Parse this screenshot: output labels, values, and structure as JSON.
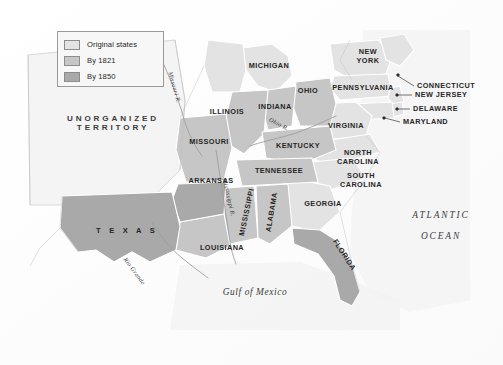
{
  "figure": {
    "background_color": "#fdfdfd",
    "ocean_color": "#f2f2f2"
  },
  "legend": {
    "name": "map-legend",
    "border_color": "#9a9a9a",
    "background_color": "#f7f7f7",
    "items": [
      {
        "label": "Original states",
        "color": "#e3e3e3"
      },
      {
        "label": "By 1821",
        "color": "#c6c6c6"
      },
      {
        "label": "By 1850",
        "color": "#a9a9a9"
      }
    ]
  },
  "map": {
    "territory": {
      "line1": "UNORGANIZED",
      "line2": "TERRITORY"
    },
    "water_bodies": [
      {
        "name": "atlantic-ocean",
        "line1": "ATLANTIC",
        "line2": "OCEAN"
      },
      {
        "name": "gulf-of-mexico",
        "line1": "Gulf of Mexico",
        "line2": ""
      }
    ],
    "rivers": [
      {
        "name": "missouri-river",
        "label": "Missouri R."
      },
      {
        "name": "ohio-river",
        "label": "Ohio R."
      },
      {
        "name": "mississippi-river",
        "label": "Mississippi R."
      },
      {
        "name": "rio-grande",
        "label": "Rio Grande"
      }
    ],
    "states": [
      {
        "name": "michigan",
        "label": "MICHIGAN",
        "tier": "original"
      },
      {
        "name": "ohio",
        "label": "OHIO",
        "tier": "by1821"
      },
      {
        "name": "indiana",
        "label": "INDIANA",
        "tier": "by1821"
      },
      {
        "name": "illinois",
        "label": "ILLINOIS",
        "tier": "by1821"
      },
      {
        "name": "missouri",
        "label": "MISSOURI",
        "tier": "by1821"
      },
      {
        "name": "kentucky",
        "label": "KENTUCKY",
        "tier": "by1821"
      },
      {
        "name": "tennessee",
        "label": "TENNESSEE",
        "tier": "by1821"
      },
      {
        "name": "arkansas",
        "label": "ARKANSAS",
        "tier": "by1850"
      },
      {
        "name": "mississippi",
        "label": "MISSISSIPPI",
        "tier": "by1821"
      },
      {
        "name": "alabama",
        "label": "ALABAMA",
        "tier": "by1821"
      },
      {
        "name": "louisiana",
        "label": "LOUISIANA",
        "tier": "by1821"
      },
      {
        "name": "texas",
        "label": "T E X A S",
        "tier": "by1850"
      },
      {
        "name": "florida",
        "label": "FLORIDA",
        "tier": "by1850"
      },
      {
        "name": "georgia",
        "label": "GEORGIA",
        "tier": "original"
      },
      {
        "name": "new-york",
        "label1": "NEW",
        "label2": "YORK",
        "tier": "original"
      },
      {
        "name": "pennsylvania",
        "label": "PENNSYLVANIA",
        "tier": "original"
      },
      {
        "name": "virginia",
        "label": "VIRGINIA",
        "tier": "original"
      },
      {
        "name": "north-carolina",
        "label1": "NORTH",
        "label2": "CAROLINA",
        "tier": "original"
      },
      {
        "name": "south-carolina",
        "label1": "SOUTH",
        "label2": "CAROLINA",
        "tier": "original"
      }
    ],
    "callouts": [
      {
        "name": "connecticut",
        "label": "CONNECTICUT"
      },
      {
        "name": "new-jersey",
        "label": "NEW JERSEY"
      },
      {
        "name": "delaware",
        "label": "DELAWARE"
      },
      {
        "name": "maryland",
        "label": "MARYLAND"
      }
    ]
  }
}
